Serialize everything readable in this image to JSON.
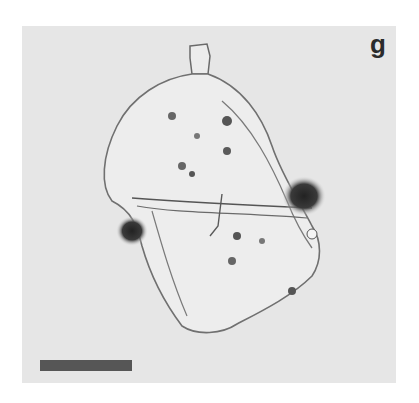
{
  "figure": {
    "panel_label": "g",
    "scale_bar": {
      "color": "#565656"
    },
    "colors": {
      "background": "#e6e6e6",
      "outline": "#6e6e6e",
      "dark_spot": "#2e2e2e"
    }
  }
}
